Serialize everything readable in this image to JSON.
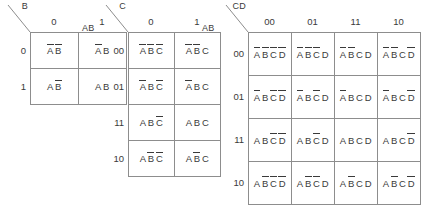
{
  "figure": {
    "type": "karnaugh-maps",
    "line_color": "#8d8d8d",
    "text_color": "#3a3a3a"
  },
  "maps": [
    {
      "id": "kmap-2-var",
      "row_var": "A",
      "col_var": "B",
      "col_labels": [
        "0",
        "1"
      ],
      "row_labels": [
        "0",
        "1"
      ],
      "cells": [
        [
          [
            {
              "name": "A",
              "bar": true
            },
            {
              "name": "B",
              "bar": true
            }
          ],
          [
            {
              "name": "A",
              "bar": true
            },
            {
              "name": "B",
              "bar": false
            }
          ]
        ],
        [
          [
            {
              "name": "A",
              "bar": false
            },
            {
              "name": "B",
              "bar": true
            }
          ],
          [
            {
              "name": "A",
              "bar": false
            },
            {
              "name": "B",
              "bar": false
            }
          ]
        ]
      ]
    },
    {
      "id": "kmap-3-var",
      "row_var": "AB",
      "col_var": "C",
      "col_labels": [
        "0",
        "1"
      ],
      "row_labels": [
        "00",
        "01",
        "11",
        "10"
      ],
      "cells": [
        [
          [
            {
              "name": "A",
              "bar": true
            },
            {
              "name": "B",
              "bar": true
            },
            {
              "name": "C",
              "bar": true
            }
          ],
          [
            {
              "name": "A",
              "bar": true
            },
            {
              "name": "B",
              "bar": true
            },
            {
              "name": "C",
              "bar": false
            }
          ]
        ],
        [
          [
            {
              "name": "A",
              "bar": true
            },
            {
              "name": "B",
              "bar": false
            },
            {
              "name": "C",
              "bar": true
            }
          ],
          [
            {
              "name": "A",
              "bar": true
            },
            {
              "name": "B",
              "bar": false
            },
            {
              "name": "C",
              "bar": false
            }
          ]
        ],
        [
          [
            {
              "name": "A",
              "bar": false
            },
            {
              "name": "B",
              "bar": false
            },
            {
              "name": "C",
              "bar": true
            }
          ],
          [
            {
              "name": "A",
              "bar": false
            },
            {
              "name": "B",
              "bar": false
            },
            {
              "name": "C",
              "bar": false
            }
          ]
        ],
        [
          [
            {
              "name": "A",
              "bar": false
            },
            {
              "name": "B",
              "bar": true
            },
            {
              "name": "C",
              "bar": true
            }
          ],
          [
            {
              "name": "A",
              "bar": false
            },
            {
              "name": "B",
              "bar": true
            },
            {
              "name": "C",
              "bar": false
            }
          ]
        ]
      ]
    },
    {
      "id": "kmap-4-var",
      "row_var": "AB",
      "col_var": "CD",
      "col_labels": [
        "00",
        "01",
        "11",
        "10"
      ],
      "row_labels": [
        "00",
        "01",
        "11",
        "10"
      ],
      "cells": [
        [
          [
            {
              "name": "A",
              "bar": true
            },
            {
              "name": "B",
              "bar": true
            },
            {
              "name": "C",
              "bar": true
            },
            {
              "name": "D",
              "bar": true
            }
          ],
          [
            {
              "name": "A",
              "bar": true
            },
            {
              "name": "B",
              "bar": true
            },
            {
              "name": "C",
              "bar": true
            },
            {
              "name": "D",
              "bar": false
            }
          ],
          [
            {
              "name": "A",
              "bar": true
            },
            {
              "name": "B",
              "bar": true
            },
            {
              "name": "C",
              "bar": false
            },
            {
              "name": "D",
              "bar": false
            }
          ],
          [
            {
              "name": "A",
              "bar": true
            },
            {
              "name": "B",
              "bar": true
            },
            {
              "name": "C",
              "bar": false
            },
            {
              "name": "D",
              "bar": true
            }
          ]
        ],
        [
          [
            {
              "name": "A",
              "bar": true
            },
            {
              "name": "B",
              "bar": false
            },
            {
              "name": "C",
              "bar": true
            },
            {
              "name": "D",
              "bar": true
            }
          ],
          [
            {
              "name": "A",
              "bar": true
            },
            {
              "name": "B",
              "bar": false
            },
            {
              "name": "C",
              "bar": true
            },
            {
              "name": "D",
              "bar": false
            }
          ],
          [
            {
              "name": "A",
              "bar": true
            },
            {
              "name": "B",
              "bar": false
            },
            {
              "name": "C",
              "bar": false
            },
            {
              "name": "D",
              "bar": false
            }
          ],
          [
            {
              "name": "A",
              "bar": true
            },
            {
              "name": "B",
              "bar": false
            },
            {
              "name": "C",
              "bar": false
            },
            {
              "name": "D",
              "bar": true
            }
          ]
        ],
        [
          [
            {
              "name": "A",
              "bar": false
            },
            {
              "name": "B",
              "bar": false
            },
            {
              "name": "C",
              "bar": true
            },
            {
              "name": "D",
              "bar": true
            }
          ],
          [
            {
              "name": "A",
              "bar": false
            },
            {
              "name": "B",
              "bar": false
            },
            {
              "name": "C",
              "bar": true
            },
            {
              "name": "D",
              "bar": false
            }
          ],
          [
            {
              "name": "A",
              "bar": false
            },
            {
              "name": "B",
              "bar": false
            },
            {
              "name": "C",
              "bar": false
            },
            {
              "name": "D",
              "bar": false
            }
          ],
          [
            {
              "name": "A",
              "bar": false
            },
            {
              "name": "B",
              "bar": false
            },
            {
              "name": "C",
              "bar": false
            },
            {
              "name": "D",
              "bar": true
            }
          ]
        ],
        [
          [
            {
              "name": "A",
              "bar": false
            },
            {
              "name": "B",
              "bar": true
            },
            {
              "name": "C",
              "bar": true
            },
            {
              "name": "D",
              "bar": true
            }
          ],
          [
            {
              "name": "A",
              "bar": false
            },
            {
              "name": "B",
              "bar": true
            },
            {
              "name": "C",
              "bar": true
            },
            {
              "name": "D",
              "bar": false
            }
          ],
          [
            {
              "name": "A",
              "bar": false
            },
            {
              "name": "B",
              "bar": true
            },
            {
              "name": "C",
              "bar": false
            },
            {
              "name": "D",
              "bar": false
            }
          ],
          [
            {
              "name": "A",
              "bar": false
            },
            {
              "name": "B",
              "bar": true
            },
            {
              "name": "C",
              "bar": false
            },
            {
              "name": "D",
              "bar": true
            }
          ]
        ]
      ]
    }
  ],
  "layout": {
    "maps": [
      {
        "left": 30,
        "top": 32,
        "cell_w": 48,
        "cell_h": 36
      },
      {
        "left": 128,
        "top": 32,
        "cell_w": 46,
        "cell_h": 36
      },
      {
        "left": 248,
        "top": 32,
        "cell_w": 43,
        "cell_h": 43
      }
    ]
  }
}
